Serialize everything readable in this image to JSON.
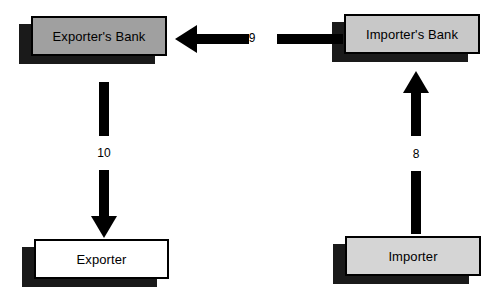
{
  "diagram": {
    "background_color": "#ffffff",
    "line_color": "#000000",
    "shadow_color": "#1a1a1a",
    "nodes": [
      {
        "id": "exporters-bank",
        "label": "Exporter's Bank",
        "fill": "#a0a0a0",
        "x": 31,
        "y": 16,
        "width": 136,
        "height": 40
      },
      {
        "id": "importers-bank",
        "label": "Importer's Bank",
        "fill": "#c8c8c8",
        "x": 344,
        "y": 14,
        "width": 136,
        "height": 40
      },
      {
        "id": "exporter",
        "label": "Exporter",
        "fill": "#ffffff",
        "x": 34,
        "y": 239,
        "width": 135,
        "height": 40
      },
      {
        "id": "importer",
        "label": "Importer",
        "fill": "#d5d5d5",
        "x": 345,
        "y": 236,
        "width": 136,
        "height": 40
      }
    ],
    "edges": [
      {
        "id": "edge-9",
        "label": "9",
        "from": "importers-bank",
        "to": "exporters-bank",
        "direction": "left"
      },
      {
        "id": "edge-10",
        "label": "10",
        "from": "exporters-bank",
        "to": "exporter",
        "direction": "down"
      },
      {
        "id": "edge-8",
        "label": "8",
        "from": "importer",
        "to": "importers-bank",
        "direction": "up"
      }
    ]
  }
}
